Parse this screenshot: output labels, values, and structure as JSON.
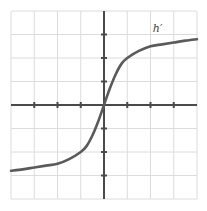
{
  "chart_data": {
    "type": "line",
    "title": "",
    "xlabel": "",
    "ylabel": "",
    "xlim": [
      -4,
      4
    ],
    "ylim": [
      -4,
      4
    ],
    "grid": true,
    "legend": "none",
    "x_ticks": [
      -3,
      -2,
      -1,
      1,
      2,
      3
    ],
    "y_ticks": [
      -3,
      -2,
      -1,
      1,
      2,
      3
    ],
    "tick_labels_shown": false,
    "annotations": [
      {
        "text": "h′",
        "x": 2.1,
        "y": 3.1
      }
    ],
    "series": [
      {
        "name": "h′",
        "x": [
          -4,
          -3.5,
          -3,
          -2.5,
          -2,
          -1.5,
          -1,
          -0.75,
          -0.5,
          -0.25,
          0,
          0.25,
          0.5,
          0.75,
          1,
          1.5,
          2,
          2.5,
          3,
          3.5,
          4
        ],
        "y": [
          -2.8,
          -2.74,
          -2.66,
          -2.58,
          -2.5,
          -2.3,
          -2.0,
          -1.75,
          -1.3,
          -0.7,
          0,
          0.7,
          1.3,
          1.75,
          2.0,
          2.3,
          2.5,
          2.58,
          2.66,
          2.74,
          2.8
        ],
        "color": "#5a5a5a"
      }
    ]
  },
  "colors": {
    "grid": "#dcdcdc",
    "axis": "#4a4a4a",
    "curve": "#5a5a5a"
  },
  "curve_label": "h′"
}
